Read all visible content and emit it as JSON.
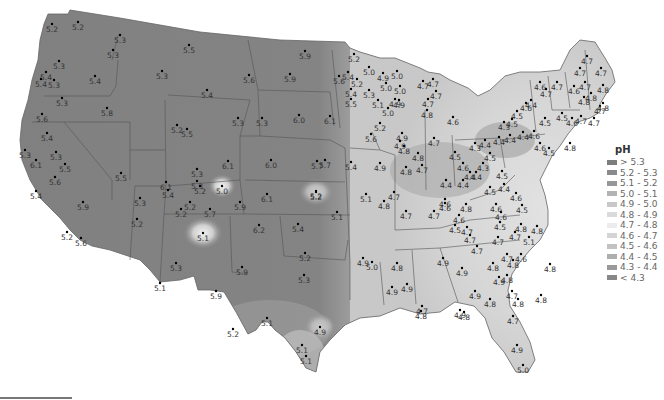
{
  "legend": {
    "title": "pH",
    "items": [
      {
        "label": "> 5.3",
        "color": "#7d7d7d"
      },
      {
        "label": "5.2 - 5.3",
        "color": "#8a8a8a"
      },
      {
        "label": "5.1 - 5.2",
        "color": "#979797"
      },
      {
        "label": "5.0 - 5.1",
        "color": "#b3b3b3"
      },
      {
        "label": "4.9 - 5.0",
        "color": "#c8c8c8"
      },
      {
        "label": "4.8 - 4.9",
        "color": "#dadada"
      },
      {
        "label": "4.7 - 4.8",
        "color": "#ececec"
      },
      {
        "label": "4.6 - 4.7",
        "color": "#d4d4d4"
      },
      {
        "label": "4.5 - 4.6",
        "color": "#c2c2c2"
      },
      {
        "label": "4.4 - 4.5",
        "color": "#aeaeae"
      },
      {
        "label": "4.3 - 4.4",
        "color": "#9a9a9a"
      },
      {
        "label": "< 4.3",
        "color": "#888888"
      }
    ]
  },
  "stations": [
    {
      "x": 52,
      "y": 24,
      "v": "5.2"
    },
    {
      "x": 78,
      "y": 22,
      "v": "5.2"
    },
    {
      "x": 120,
      "y": 35,
      "v": "5.3"
    },
    {
      "x": 113,
      "y": 50,
      "v": "5.3"
    },
    {
      "x": 59,
      "y": 61,
      "v": "5.3"
    },
    {
      "x": 46,
      "y": 72,
      "v": "5.4"
    },
    {
      "x": 41,
      "y": 79,
      "v": "5.4"
    },
    {
      "x": 54,
      "y": 80,
      "v": "5.3"
    },
    {
      "x": 95,
      "y": 76,
      "v": "5.4"
    },
    {
      "x": 62,
      "y": 98,
      "v": "5.3"
    },
    {
      "x": 107,
      "y": 108,
      "v": "5.8"
    },
    {
      "x": 42,
      "y": 114,
      "v": "5.6"
    },
    {
      "x": 47,
      "y": 133,
      "v": "5.4"
    },
    {
      "x": 56,
      "y": 152,
      "v": "5.3"
    },
    {
      "x": 36,
      "y": 160,
      "v": "6.1"
    },
    {
      "x": 65,
      "y": 164,
      "v": "5.5"
    },
    {
      "x": 25,
      "y": 150,
      "v": "5.3"
    },
    {
      "x": 55,
      "y": 177,
      "v": "5.6"
    },
    {
      "x": 36,
      "y": 191,
      "v": "5.4"
    },
    {
      "x": 83,
      "y": 202,
      "v": "5.9"
    },
    {
      "x": 121,
      "y": 173,
      "v": "5.5"
    },
    {
      "x": 140,
      "y": 198,
      "v": "5.3"
    },
    {
      "x": 67,
      "y": 232,
      "v": "5.2"
    },
    {
      "x": 81,
      "y": 238,
      "v": "5.6"
    },
    {
      "x": 137,
      "y": 219,
      "v": "5.2"
    },
    {
      "x": 189,
      "y": 45,
      "v": "5.5"
    },
    {
      "x": 162,
      "y": 71,
      "v": "5.3"
    },
    {
      "x": 207,
      "y": 90,
      "v": "5.4"
    },
    {
      "x": 249,
      "y": 75,
      "v": "5.6"
    },
    {
      "x": 305,
      "y": 51,
      "v": "5.9"
    },
    {
      "x": 290,
      "y": 74,
      "v": "5.9"
    },
    {
      "x": 238,
      "y": 118,
      "v": "5.3"
    },
    {
      "x": 262,
      "y": 118,
      "v": "5.3"
    },
    {
      "x": 299,
      "y": 115,
      "v": "6.0"
    },
    {
      "x": 330,
      "y": 116,
      "v": "6.1"
    },
    {
      "x": 177,
      "y": 125,
      "v": "5.2"
    },
    {
      "x": 187,
      "y": 129,
      "v": "5.5"
    },
    {
      "x": 271,
      "y": 160,
      "v": "6.0"
    },
    {
      "x": 317,
      "y": 161,
      "v": "5.7"
    },
    {
      "x": 228,
      "y": 161,
      "v": "6.1"
    },
    {
      "x": 197,
      "y": 169,
      "v": "5.3"
    },
    {
      "x": 166,
      "y": 182,
      "v": "6.1"
    },
    {
      "x": 168,
      "y": 190,
      "v": "5.4"
    },
    {
      "x": 197,
      "y": 181,
      "v": "5.3"
    },
    {
      "x": 200,
      "y": 186,
      "v": "5.2"
    },
    {
      "x": 222,
      "y": 186,
      "v": "5.0"
    },
    {
      "x": 240,
      "y": 202,
      "v": "5.9"
    },
    {
      "x": 190,
      "y": 202,
      "v": "5.2"
    },
    {
      "x": 210,
      "y": 209,
      "v": "5.7"
    },
    {
      "x": 181,
      "y": 209,
      "v": "5.2"
    },
    {
      "x": 267,
      "y": 194,
      "v": "6.1"
    },
    {
      "x": 316,
      "y": 192,
      "v": "5.2"
    },
    {
      "x": 337,
      "y": 212,
      "v": "5.1"
    },
    {
      "x": 203,
      "y": 233,
      "v": "5.1"
    },
    {
      "x": 259,
      "y": 225,
      "v": "6.2"
    },
    {
      "x": 298,
      "y": 224,
      "v": "5.4"
    },
    {
      "x": 305,
      "y": 253,
      "v": "5.2"
    },
    {
      "x": 176,
      "y": 263,
      "v": "5.3"
    },
    {
      "x": 242,
      "y": 267,
      "v": "5.9"
    },
    {
      "x": 304,
      "y": 275,
      "v": "5.3"
    },
    {
      "x": 160,
      "y": 283,
      "v": "5.1"
    },
    {
      "x": 216,
      "y": 291,
      "v": "5.9"
    },
    {
      "x": 267,
      "y": 318,
      "v": "5.1"
    },
    {
      "x": 233,
      "y": 329,
      "v": "5.2"
    },
    {
      "x": 320,
      "y": 327,
      "v": "4.9"
    },
    {
      "x": 302,
      "y": 345,
      "v": "5.1"
    },
    {
      "x": 306,
      "y": 356,
      "v": "5.1"
    },
    {
      "x": 354,
      "y": 54,
      "v": "5.2"
    },
    {
      "x": 369,
      "y": 67,
      "v": "5.0"
    },
    {
      "x": 383,
      "y": 73,
      "v": "4.9"
    },
    {
      "x": 397,
      "y": 71,
      "v": "5.0"
    },
    {
      "x": 348,
      "y": 72,
      "v": "5.4"
    },
    {
      "x": 339,
      "y": 76,
      "v": "5.6"
    },
    {
      "x": 357,
      "y": 79,
      "v": "5.2"
    },
    {
      "x": 351,
      "y": 89,
      "v": "5.4"
    },
    {
      "x": 351,
      "y": 99,
      "v": "5.5"
    },
    {
      "x": 369,
      "y": 90,
      "v": "5.3"
    },
    {
      "x": 386,
      "y": 83,
      "v": "5.0"
    },
    {
      "x": 400,
      "y": 86,
      "v": "5.0"
    },
    {
      "x": 395,
      "y": 99,
      "v": "4.9"
    },
    {
      "x": 399,
      "y": 100,
      "v": "4.9"
    },
    {
      "x": 378,
      "y": 100,
      "v": "5.1"
    },
    {
      "x": 388,
      "y": 108,
      "v": "5.0"
    },
    {
      "x": 380,
      "y": 123,
      "v": "5.2"
    },
    {
      "x": 371,
      "y": 134,
      "v": "5.6"
    },
    {
      "x": 402,
      "y": 133,
      "v": "4.9"
    },
    {
      "x": 400,
      "y": 141,
      "v": "4.9"
    },
    {
      "x": 423,
      "y": 81,
      "v": "4.7"
    },
    {
      "x": 433,
      "y": 79,
      "v": "4.7"
    },
    {
      "x": 436,
      "y": 91,
      "v": "4.7"
    },
    {
      "x": 428,
      "y": 99,
      "v": "4.7"
    },
    {
      "x": 427,
      "y": 110,
      "v": "4.8"
    },
    {
      "x": 453,
      "y": 117,
      "v": "4.6"
    },
    {
      "x": 434,
      "y": 138,
      "v": "4.7"
    },
    {
      "x": 325,
      "y": 160,
      "v": "5.7"
    },
    {
      "x": 351,
      "y": 162,
      "v": "5.4"
    },
    {
      "x": 380,
      "y": 163,
      "v": "4.9"
    },
    {
      "x": 404,
      "y": 146,
      "v": "4.8"
    },
    {
      "x": 406,
      "y": 167,
      "v": "4.8"
    },
    {
      "x": 418,
      "y": 153,
      "v": "4.8"
    },
    {
      "x": 422,
      "y": 165,
      "v": "4.7"
    },
    {
      "x": 394,
      "y": 192,
      "v": "4.7"
    },
    {
      "x": 384,
      "y": 201,
      "v": "4.8"
    },
    {
      "x": 406,
      "y": 211,
      "v": "4.7"
    },
    {
      "x": 316,
      "y": 191,
      "v": "5.2"
    },
    {
      "x": 366,
      "y": 194,
      "v": "5.1"
    },
    {
      "x": 434,
      "y": 211,
      "v": "4.7"
    },
    {
      "x": 445,
      "y": 203,
      "v": "4.6"
    },
    {
      "x": 455,
      "y": 152,
      "v": "4.5"
    },
    {
      "x": 463,
      "y": 163,
      "v": "4.6"
    },
    {
      "x": 470,
      "y": 172,
      "v": "4.4"
    },
    {
      "x": 446,
      "y": 180,
      "v": "4.4"
    },
    {
      "x": 463,
      "y": 180,
      "v": "4.4"
    },
    {
      "x": 483,
      "y": 163,
      "v": "4.3"
    },
    {
      "x": 490,
      "y": 153,
      "v": "4.5"
    },
    {
      "x": 504,
      "y": 184,
      "v": "4.4"
    },
    {
      "x": 490,
      "y": 187,
      "v": "4.5"
    },
    {
      "x": 445,
      "y": 199,
      "v": "4.6"
    },
    {
      "x": 466,
      "y": 204,
      "v": "4.8"
    },
    {
      "x": 496,
      "y": 204,
      "v": "4.6"
    },
    {
      "x": 516,
      "y": 193,
      "v": "4.6"
    },
    {
      "x": 522,
      "y": 205,
      "v": "4.5"
    },
    {
      "x": 501,
      "y": 212,
      "v": "4.6"
    },
    {
      "x": 459,
      "y": 215,
      "v": "4.6"
    },
    {
      "x": 455,
      "y": 225,
      "v": "4.5"
    },
    {
      "x": 467,
      "y": 227,
      "v": "4.7"
    },
    {
      "x": 470,
      "y": 235,
      "v": "4.7"
    },
    {
      "x": 500,
      "y": 222,
      "v": "4.5"
    },
    {
      "x": 521,
      "y": 224,
      "v": "4.8"
    },
    {
      "x": 537,
      "y": 226,
      "v": "4.8"
    },
    {
      "x": 515,
      "y": 232,
      "v": "4.7"
    },
    {
      "x": 529,
      "y": 237,
      "v": "5.1"
    },
    {
      "x": 477,
      "y": 246,
      "v": "4.7"
    },
    {
      "x": 498,
      "y": 237,
      "v": "4.7"
    },
    {
      "x": 476,
      "y": 172,
      "v": "4.4"
    },
    {
      "x": 502,
      "y": 171,
      "v": "4.5"
    },
    {
      "x": 475,
      "y": 143,
      "v": "4.3"
    },
    {
      "x": 499,
      "y": 137,
      "v": "4.4"
    },
    {
      "x": 510,
      "y": 135,
      "v": "4.4"
    },
    {
      "x": 485,
      "y": 140,
      "v": "4.4"
    },
    {
      "x": 523,
      "y": 132,
      "v": "4.4"
    },
    {
      "x": 534,
      "y": 131,
      "v": "4.6"
    },
    {
      "x": 531,
      "y": 100,
      "v": "4.4"
    },
    {
      "x": 526,
      "y": 103,
      "v": "4.6"
    },
    {
      "x": 517,
      "y": 111,
      "v": "4.5"
    },
    {
      "x": 512,
      "y": 119,
      "v": "4.5"
    },
    {
      "x": 504,
      "y": 122,
      "v": "4.3"
    },
    {
      "x": 545,
      "y": 118,
      "v": "4.5"
    },
    {
      "x": 540,
      "y": 143,
      "v": "4.6"
    },
    {
      "x": 549,
      "y": 148,
      "v": "4.5"
    },
    {
      "x": 570,
      "y": 143,
      "v": "4.8"
    },
    {
      "x": 540,
      "y": 82,
      "v": "4.6"
    },
    {
      "x": 546,
      "y": 89,
      "v": "4.7"
    },
    {
      "x": 557,
      "y": 82,
      "v": "4.7"
    },
    {
      "x": 574,
      "y": 86,
      "v": "4.6"
    },
    {
      "x": 584,
      "y": 97,
      "v": "4.8"
    },
    {
      "x": 562,
      "y": 113,
      "v": "4.5"
    },
    {
      "x": 581,
      "y": 116,
      "v": "4.7"
    },
    {
      "x": 572,
      "y": 118,
      "v": "4.6"
    },
    {
      "x": 594,
      "y": 118,
      "v": "4.7"
    },
    {
      "x": 600,
      "y": 106,
      "v": "4.7"
    },
    {
      "x": 580,
      "y": 68,
      "v": "4.7"
    },
    {
      "x": 585,
      "y": 82,
      "v": "4.7"
    },
    {
      "x": 603,
      "y": 85,
      "v": "4.8"
    },
    {
      "x": 591,
      "y": 93,
      "v": "4.8"
    },
    {
      "x": 603,
      "y": 103,
      "v": "4.8"
    },
    {
      "x": 587,
      "y": 56,
      "v": "4.7"
    },
    {
      "x": 601,
      "y": 68,
      "v": "4.7"
    },
    {
      "x": 363,
      "y": 258,
      "v": "4.9"
    },
    {
      "x": 372,
      "y": 262,
      "v": "5.0"
    },
    {
      "x": 397,
      "y": 263,
      "v": "4.8"
    },
    {
      "x": 392,
      "y": 287,
      "v": "4.9"
    },
    {
      "x": 407,
      "y": 284,
      "v": "4.9"
    },
    {
      "x": 421,
      "y": 311,
      "v": "4.8"
    },
    {
      "x": 422,
      "y": 306,
      "v": "4.7"
    },
    {
      "x": 462,
      "y": 268,
      "v": "4.9"
    },
    {
      "x": 475,
      "y": 291,
      "v": "4.9"
    },
    {
      "x": 490,
      "y": 299,
      "v": "4.8"
    },
    {
      "x": 460,
      "y": 310,
      "v": "4.9"
    },
    {
      "x": 464,
      "y": 312,
      "v": "4.8"
    },
    {
      "x": 443,
      "y": 258,
      "v": "4.9"
    },
    {
      "x": 493,
      "y": 263,
      "v": "4.8"
    },
    {
      "x": 499,
      "y": 277,
      "v": "4.9"
    },
    {
      "x": 513,
      "y": 260,
      "v": "4.8"
    },
    {
      "x": 507,
      "y": 275,
      "v": "4.8"
    },
    {
      "x": 512,
      "y": 291,
      "v": "4.7"
    },
    {
      "x": 513,
      "y": 316,
      "v": "4.7"
    },
    {
      "x": 517,
      "y": 345,
      "v": "4.9"
    },
    {
      "x": 523,
      "y": 365,
      "v": "5.0"
    },
    {
      "x": 518,
      "y": 299,
      "v": "4.8"
    },
    {
      "x": 507,
      "y": 254,
      "v": "4.7"
    },
    {
      "x": 521,
      "y": 254,
      "v": "4.6"
    },
    {
      "x": 541,
      "y": 295,
      "v": "4.8"
    },
    {
      "x": 550,
      "y": 264,
      "v": "4.8"
    }
  ]
}
